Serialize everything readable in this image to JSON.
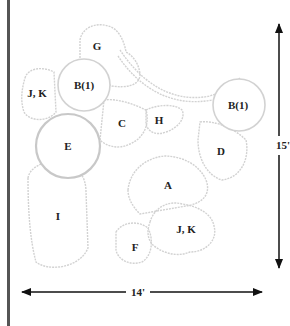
{
  "diagram": {
    "type": "garden planting plan",
    "plants": [
      {
        "id": "g",
        "label": "G",
        "x": 97,
        "y": 46
      },
      {
        "id": "b1-left",
        "label": "B(1)",
        "x": 84,
        "y": 85
      },
      {
        "id": "jk-left",
        "label": "J, K",
        "x": 37,
        "y": 93
      },
      {
        "id": "c",
        "label": "C",
        "x": 122,
        "y": 123
      },
      {
        "id": "h",
        "label": "H",
        "x": 159,
        "y": 120
      },
      {
        "id": "e",
        "label": "E",
        "x": 68,
        "y": 146
      },
      {
        "id": "b1-right",
        "label": "B(1)",
        "x": 238,
        "y": 105
      },
      {
        "id": "d",
        "label": "D",
        "x": 221,
        "y": 151
      },
      {
        "id": "a",
        "label": "A",
        "x": 168,
        "y": 185
      },
      {
        "id": "i",
        "label": "I",
        "x": 58,
        "y": 216
      },
      {
        "id": "jk-right",
        "label": "J, K",
        "x": 186,
        "y": 229
      },
      {
        "id": "f",
        "label": "F",
        "x": 135,
        "y": 247
      }
    ],
    "dimensions": {
      "width_label": "14'",
      "height_label": "15'"
    },
    "colors": {
      "outline": "#cfcfcf",
      "arrow": "#111111",
      "border": "#555555"
    }
  }
}
